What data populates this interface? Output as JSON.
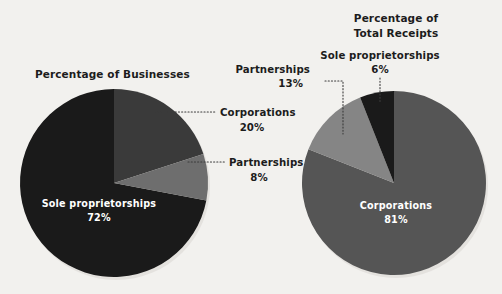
{
  "figure": {
    "background_color": "#f2f1ee",
    "width": 502,
    "height": 294
  },
  "chart_data": [
    {
      "type": "pie",
      "id": "percentage-of-businesses",
      "title": "Percentage of Businesses",
      "title_lines": [
        "Percentage of Businesses"
      ],
      "categories": [
        "Corporations",
        "Partnerships",
        "Sole proprietorships"
      ],
      "values": [
        20,
        8,
        72
      ],
      "value_labels": [
        "20%",
        "8%",
        "72%"
      ],
      "colors": [
        "#3a3a3a",
        "#6e6e6e",
        "#1a1a1a"
      ],
      "start_angle_deg": 0,
      "direction": "clockwise",
      "legend": "external-callout-labels",
      "grid": false,
      "center_px": [
        114,
        183
      ],
      "radius_px": 94,
      "labels": [
        {
          "name": "Corporations",
          "value": "20%",
          "placement": "outside-right",
          "leader": true
        },
        {
          "name": "Partnerships",
          "value": "8%",
          "placement": "outside-right",
          "leader": true
        },
        {
          "name": "Sole proprietorships",
          "value": "72%",
          "placement": "inside",
          "leader": false
        }
      ]
    },
    {
      "type": "pie",
      "id": "percentage-of-total-receipts",
      "title": "Percentage of Total Receipts",
      "title_lines": [
        "Percentage of",
        "Total Receipts"
      ],
      "categories": [
        "Corporations",
        "Partnerships",
        "Sole proprietorships"
      ],
      "values": [
        81,
        13,
        6
      ],
      "value_labels": [
        "81%",
        "13%",
        "6%"
      ],
      "colors": [
        "#555555",
        "#858585",
        "#1a1a1a"
      ],
      "start_angle_deg": 0,
      "direction": "clockwise",
      "legend": "external-callout-labels",
      "grid": false,
      "center_px": [
        394,
        183
      ],
      "radius_px": 92,
      "labels": [
        {
          "name": "Corporations",
          "value": "81%",
          "placement": "inside",
          "leader": false
        },
        {
          "name": "Partnerships",
          "value": "13%",
          "placement": "outside-top-left",
          "leader": true
        },
        {
          "name": "Sole proprietorships",
          "value": "6%",
          "placement": "outside-top",
          "leader": true
        }
      ]
    }
  ],
  "left_chart": {
    "title": "Percentage of Businesses",
    "corporations_name": "Corporations",
    "corporations_value": "20%",
    "partnerships_name": "Partnerships",
    "partnerships_value": "8%",
    "sole_name": "Sole proprietorships",
    "sole_value": "72%"
  },
  "right_chart": {
    "title_line1": "Percentage of",
    "title_line2": "Total Receipts",
    "sole_name": "Sole proprietorships",
    "sole_value": "6%",
    "partnerships_name": "Partnerships",
    "partnerships_value": "13%",
    "corporations_name": "Corporations",
    "corporations_value": "81%"
  }
}
